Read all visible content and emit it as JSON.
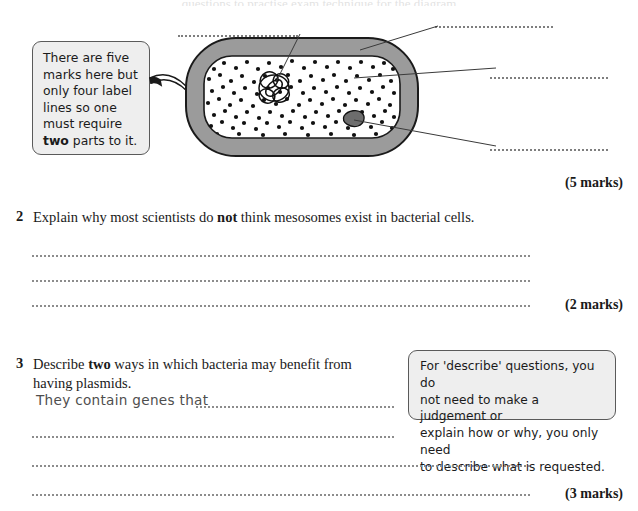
{
  "page": {
    "cutoff_header": "questions to practise exam technique for the diagram"
  },
  "diagram": {
    "name": "bacterial-cell-diagram",
    "parts": {
      "flagellum": "flagellum",
      "cell_wall": "cell wall",
      "cytoplasm": "cytoplasm",
      "circular_dna": "circular DNA",
      "plasmid": "plasmid",
      "ribosomes": "ribosomes"
    },
    "label_lines": [
      {
        "id": "label-line-top-left",
        "blank": true
      },
      {
        "id": "label-line-top-right",
        "blank": true
      },
      {
        "id": "label-line-middle-right",
        "blank": true
      },
      {
        "id": "label-line-bottom-right",
        "blank": true
      }
    ],
    "colors": {
      "cell_wall": "#9b9b9b",
      "cytoplasm": "#ffffff",
      "ribosome": "#111111",
      "plasmid": "#6d6d6d",
      "outline": "#1a1a1a"
    }
  },
  "tips": {
    "labels_tip": {
      "line1": "There are five",
      "line2": "marks here but",
      "line3": "only four label",
      "line4": "lines so one",
      "line5": "must require",
      "line6_bold": "two",
      "line6_rest": " parts to it."
    },
    "describe_tip": {
      "line1": "For 'describe' questions, you do",
      "line2": "not need to make a judgement or",
      "line3": "explain how or why, you only need",
      "line4": "to describe what is requested."
    }
  },
  "questions": [
    {
      "number": "1",
      "marks": "(5 marks)",
      "stem": ""
    },
    {
      "number": "2",
      "stem_part1": "Explain why most scientists do ",
      "stem_bold": "not",
      "stem_part2": " think mesosomes exist in bacterial cells.",
      "marks": "(2 marks)",
      "answer_lines": 3
    },
    {
      "number": "3",
      "stem_part1": "Describe ",
      "stem_bold": "two",
      "stem_part2": " ways in which bacteria may benefit from",
      "stem_line2": "having plasmids.",
      "sample_answer": "They contain genes that",
      "marks": "(3 marks)",
      "answer_lines": 4
    }
  ]
}
